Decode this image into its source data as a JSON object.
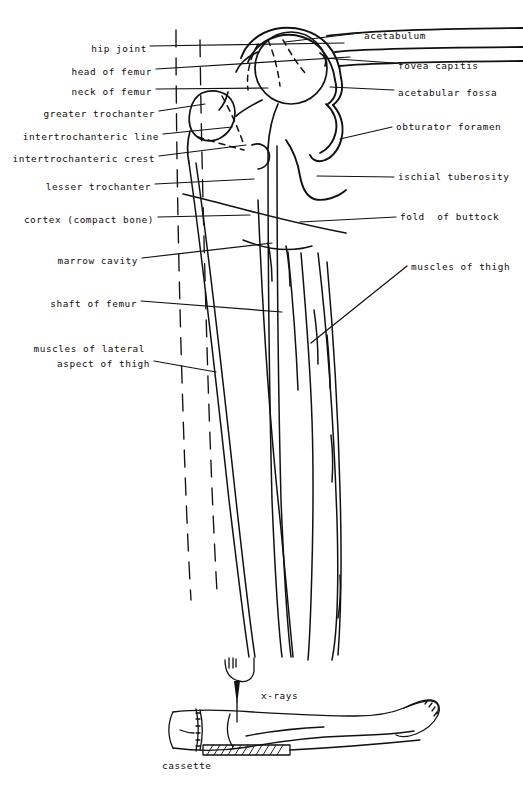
{
  "figure": {
    "ink_color": "#111111",
    "background_color": "#ffffff"
  },
  "labels_left": [
    {
      "name": "hip-joint",
      "text": "hip joint",
      "x": 147,
      "y": 49
    },
    {
      "name": "head-of-femur",
      "text": "head of femur",
      "x": 152,
      "y": 72
    },
    {
      "name": "neck-of-femur",
      "text": "neck of femur",
      "x": 152,
      "y": 92
    },
    {
      "name": "greater-trochanter",
      "text": "greater trochanter",
      "x": 155,
      "y": 114
    },
    {
      "name": "intertrochanteric-line",
      "text": "intertrochanteric line",
      "x": 159,
      "y": 137
    },
    {
      "name": "intertrochanteric-crest",
      "text": "intertrochanteric crest",
      "x": 155,
      "y": 159
    },
    {
      "name": "lesser-trochanter",
      "text": "lesser trochanter",
      "x": 151,
      "y": 187
    },
    {
      "name": "cortex-compact-bone",
      "text": "cortex (compact bone)",
      "x": 154,
      "y": 220
    },
    {
      "name": "marrow-cavity",
      "text": "marrow cavity",
      "x": 138,
      "y": 261
    },
    {
      "name": "shaft-of-femur",
      "text": "shaft of femur",
      "x": 137,
      "y": 304
    },
    {
      "name": "muscles-of-lateral-aspect-of-thigh-line1",
      "text": "muscles of lateral",
      "x": 145,
      "y": 349
    },
    {
      "name": "muscles-of-lateral-aspect-of-thigh-line2",
      "text": "aspect of thigh",
      "x": 150,
      "y": 364
    }
  ],
  "labels_right": [
    {
      "name": "acetabulum",
      "text": "acetabulum",
      "x": 364,
      "y": 36
    },
    {
      "name": "fovea-capitis",
      "text": "fovea capitis",
      "x": 398,
      "y": 66
    },
    {
      "name": "acetabular-fossa",
      "text": "acetabular fossa",
      "x": 398,
      "y": 93
    },
    {
      "name": "obturator-foramen",
      "text": "obturator foramen",
      "x": 396,
      "y": 127
    },
    {
      "name": "ischial-tuberosity",
      "text": "ischial tuberosity",
      "x": 398,
      "y": 180
    },
    {
      "name": "fold-of-buttock",
      "text": "fold  of buttock",
      "x": 400,
      "y": 220
    },
    {
      "name": "muscles-of-thigh",
      "text": "muscles of thigh",
      "x": 411,
      "y": 267
    }
  ],
  "labels_inset": [
    {
      "name": "x-rays",
      "text": "x-rays",
      "x": 261,
      "y": 696
    },
    {
      "name": "cassette",
      "text": "cassette",
      "x": 162,
      "y": 766
    }
  ]
}
